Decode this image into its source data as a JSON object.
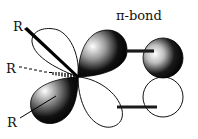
{
  "diagram": {
    "title": "π-bond",
    "substituent_labels": [
      "R",
      "R",
      "R"
    ],
    "colors": {
      "shaded_lobe": "#000000",
      "highlight": "#ffffff",
      "outline": "#111111",
      "bond_bar": "#1a1a1a"
    },
    "elements": [
      {
        "name": "upper-left-p-lobe",
        "shading": "white"
      },
      {
        "name": "upper-right-p-lobe",
        "shading": "dark"
      },
      {
        "name": "lower-left-p-lobe",
        "shading": "dark"
      },
      {
        "name": "lower-right-p-lobe",
        "shading": "white"
      },
      {
        "name": "upper-partner-orbital",
        "shading": "dark"
      },
      {
        "name": "lower-partner-orbital",
        "shading": "white"
      }
    ]
  }
}
